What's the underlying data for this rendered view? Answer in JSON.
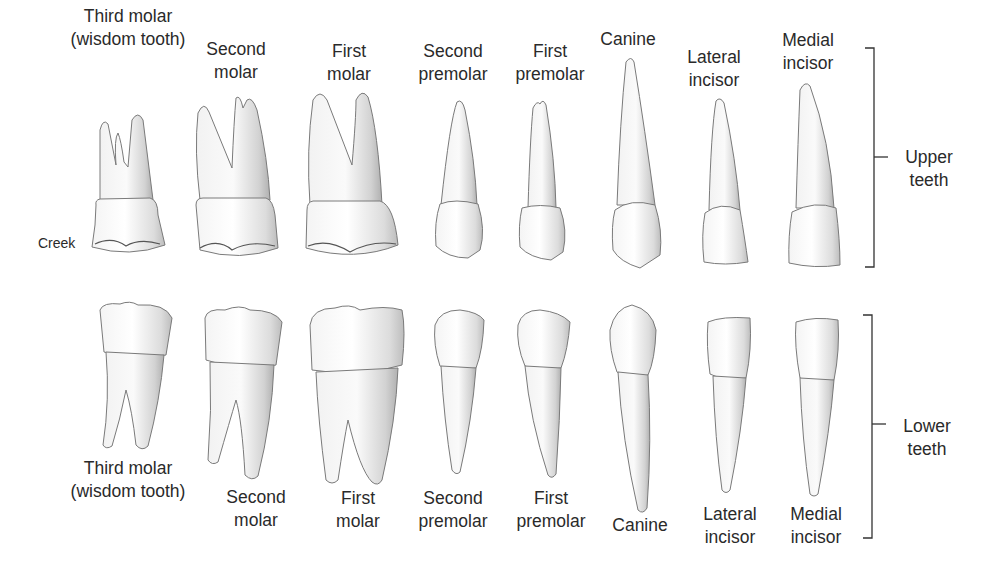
{
  "diagram": {
    "title": "",
    "upper_row": {
      "group_label": [
        "Upper",
        "teeth"
      ],
      "teeth": [
        {
          "id": "upper-third-molar",
          "label": [
            "Third molar",
            "(wisdom tooth)"
          ],
          "x": 128,
          "label_y": 5
        },
        {
          "id": "upper-second-molar",
          "label": [
            "Second",
            "molar"
          ],
          "x": 236,
          "label_y": 38
        },
        {
          "id": "upper-first-molar",
          "label": [
            "First",
            "molar"
          ],
          "x": 349,
          "label_y": 40
        },
        {
          "id": "upper-second-premolar",
          "label": [
            "Second",
            "premolar"
          ],
          "x": 453,
          "label_y": 40
        },
        {
          "id": "upper-first-premolar",
          "label": [
            "First",
            "premolar"
          ],
          "x": 550,
          "label_y": 40
        },
        {
          "id": "upper-canine",
          "label": [
            "Canine"
          ],
          "x": 628,
          "label_y": 28
        },
        {
          "id": "upper-lateral-incisor",
          "label": [
            "Lateral",
            "incisor"
          ],
          "x": 714,
          "label_y": 46
        },
        {
          "id": "upper-medial-incisor",
          "label": [
            "Medial",
            "incisor"
          ],
          "x": 808,
          "label_y": 29
        }
      ],
      "annotations": [
        {
          "text": "Creek",
          "x": 38,
          "y": 235
        }
      ]
    },
    "lower_row": {
      "group_label": [
        "Lower",
        "teeth"
      ],
      "teeth": [
        {
          "id": "lower-third-molar",
          "label": [
            "Third molar",
            "(wisdom tooth)"
          ],
          "x": 128,
          "label_y": 457
        },
        {
          "id": "lower-second-molar",
          "label": [
            "Second",
            "molar"
          ],
          "x": 256,
          "label_y": 486
        },
        {
          "id": "lower-first-molar",
          "label": [
            "First",
            "molar"
          ],
          "x": 358,
          "label_y": 487
        },
        {
          "id": "lower-second-premolar",
          "label": [
            "Second",
            "premolar"
          ],
          "x": 453,
          "label_y": 487
        },
        {
          "id": "lower-first-premolar",
          "label": [
            "First",
            "premolar"
          ],
          "x": 551,
          "label_y": 487
        },
        {
          "id": "lower-canine",
          "label": [
            "Canine"
          ],
          "x": 640,
          "label_y": 514
        },
        {
          "id": "lower-lateral-incisor",
          "label": [
            "Lateral",
            "incisor"
          ],
          "x": 730,
          "label_y": 503
        },
        {
          "id": "lower-medial-incisor",
          "label": [
            "Medial",
            "incisor"
          ],
          "x": 816,
          "label_y": 503
        }
      ]
    }
  }
}
